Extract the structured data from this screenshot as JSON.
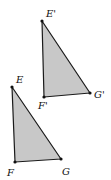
{
  "diagram": {
    "colors": {
      "fill": "#c8c8c8",
      "stroke": "#1a1a1a",
      "label": "#111111",
      "background": "#ffffff"
    },
    "triangles": [
      {
        "name": "image",
        "vertices": [
          {
            "label": "E'",
            "x": 42,
            "y": 21,
            "label_x": 46,
            "label_y": 17
          },
          {
            "label": "F'",
            "x": 44,
            "y": 97,
            "label_x": 38,
            "label_y": 109
          },
          {
            "label": "G'",
            "x": 90,
            "y": 93,
            "label_x": 94,
            "label_y": 98
          }
        ]
      },
      {
        "name": "original",
        "vertices": [
          {
            "label": "E",
            "x": 12,
            "y": 87,
            "label_x": 16,
            "label_y": 83
          },
          {
            "label": "F",
            "x": 15,
            "y": 162,
            "label_x": 7,
            "label_y": 176
          },
          {
            "label": "G",
            "x": 61,
            "y": 159,
            "label_x": 62,
            "label_y": 175
          }
        ]
      }
    ]
  }
}
